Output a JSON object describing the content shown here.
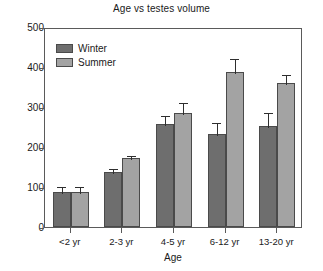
{
  "chart_data": {
    "type": "bar",
    "title": "Age vs testes volume",
    "xlabel": "Age",
    "ylabel": "",
    "categories": [
      "<2 yr",
      "2-3 yr",
      "4-5 yr",
      "6-12 yr",
      "13-20 yr"
    ],
    "series": [
      {
        "name": "Winter",
        "color": "#6e6e6e",
        "values": [
          88,
          138,
          258,
          233,
          253
        ],
        "errors": [
          17,
          12,
          25,
          33,
          38
        ]
      },
      {
        "name": "Summer",
        "color": "#a3a3a3",
        "values": [
          88,
          172,
          285,
          388,
          360
        ],
        "errors": [
          17,
          10,
          30,
          38,
          25
        ]
      }
    ],
    "ylim": [
      0,
      500
    ],
    "yticks": [
      0,
      100,
      200,
      300,
      400,
      500
    ],
    "ytick_labels": [
      "0",
      "100",
      "200",
      "300",
      "400",
      "500"
    ],
    "grid": false,
    "legend_position": "upper-left",
    "error_bars": "upper-only"
  },
  "legend": {
    "entries": [
      {
        "label": "Winter"
      },
      {
        "label": "Summer"
      }
    ]
  }
}
